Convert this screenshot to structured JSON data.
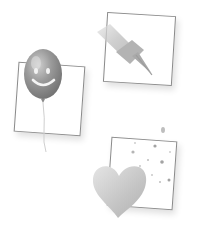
{
  "scene": {
    "background": "#ffffff",
    "card_border": "#8a8a8a",
    "cards": [
      {
        "id": "pushpin-card",
        "icon": "pushpin-icon",
        "left": 105,
        "top": 14,
        "width": 69,
        "height": 70,
        "rotate": 3.5
      },
      {
        "id": "balloon-card",
        "icon": "balloon-icon",
        "left": 16,
        "top": 64,
        "width": 67,
        "height": 70,
        "rotate": 4
      },
      {
        "id": "heart-card",
        "icon": "heart-icon",
        "left": 109,
        "top": 139,
        "width": 66,
        "height": 69,
        "rotate": 4
      }
    ],
    "colors": {
      "balloon": "#8f8f8f",
      "heart": "#c2c2c2",
      "pushpin": "#b5b5b5",
      "confetti": "#a0a0a0"
    }
  }
}
